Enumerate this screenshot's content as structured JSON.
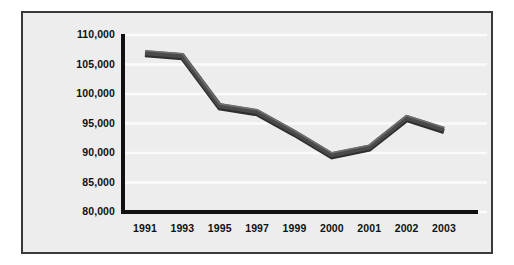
{
  "chart_data": {
    "type": "line",
    "title": "",
    "subtitle": "",
    "xlabel": "",
    "ylabel": "",
    "categories": [
      "1991",
      "1993",
      "1995",
      "1997",
      "1999",
      "2000",
      "2001",
      "2002",
      "2003"
    ],
    "values": [
      107000,
      106500,
      98000,
      97000,
      93500,
      89700,
      91000,
      96000,
      94000
    ],
    "series": [
      {
        "name": "",
        "values": [
          107000,
          106500,
          98000,
          97000,
          93500,
          89700,
          91000,
          96000,
          94000
        ]
      }
    ],
    "ylim": [
      80000,
      110000
    ],
    "ytick_values": [
      110000,
      105000,
      100000,
      95000,
      90000,
      85000,
      80000
    ],
    "ytick_labels": [
      "110,000",
      "105,000",
      "100,000",
      "95,000",
      "90,000",
      "85,000",
      "80,000"
    ],
    "xtick_labels": [
      "1991",
      "1993",
      "1995",
      "1997",
      "1999",
      "2000",
      "2001",
      "2002",
      "2003"
    ],
    "grid": "horizontal",
    "legend": "none",
    "annotations": []
  },
  "style": {
    "line_color": "#4a4a4a",
    "line_highlight": "#6f6f6f",
    "line_shadow": "#2e2e2e",
    "axis_color": "#111111",
    "panel_background": "#ededed",
    "page_background": "#ffffff",
    "frame_border_color": "#3a3a3a",
    "gridline_color": "#fbfbfb",
    "tick_text_color": "#111111"
  }
}
